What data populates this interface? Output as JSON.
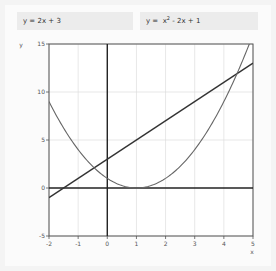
{
  "formulas": {
    "linear": {
      "lhs": "y = ",
      "rhs": "2x + 3"
    },
    "quadratic": {
      "lhs": "y = ",
      "base": "x",
      "exp": "2",
      "rest": " - 2x + 1"
    }
  },
  "chart_data": {
    "type": "line",
    "title": "",
    "xlabel": "x",
    "ylabel": "y",
    "xlim": [
      -2,
      5
    ],
    "ylim": [
      -5,
      15
    ],
    "x_ticks": [
      -2,
      -1,
      0,
      1,
      2,
      3,
      4,
      5
    ],
    "y_ticks": [
      -5,
      0,
      5,
      10,
      15
    ],
    "grid": true,
    "legend": "none (formulas shown as labels above plot)",
    "series": [
      {
        "name": "y = 2x + 3",
        "color": "#333333",
        "x": [
          -2,
          5
        ],
        "y": [
          -1,
          13
        ]
      },
      {
        "name": "y = x^2 - 2x + 1",
        "color": "#666666",
        "x": [
          -2,
          -1,
          0,
          1,
          2,
          3,
          4,
          5
        ],
        "y": [
          9,
          4,
          1,
          0,
          1,
          4,
          9,
          16
        ]
      }
    ],
    "intersections": [
      {
        "x": -0.449,
        "y": 2.101
      },
      {
        "x": 4.449,
        "y": 11.899
      }
    ]
  },
  "colors": {
    "background": "#f4f4f4",
    "panel": "#fbfbfb",
    "formula_box": "#ececec",
    "axis_zero": "#222222",
    "grid": "#dddddd",
    "frame": "#555555"
  }
}
